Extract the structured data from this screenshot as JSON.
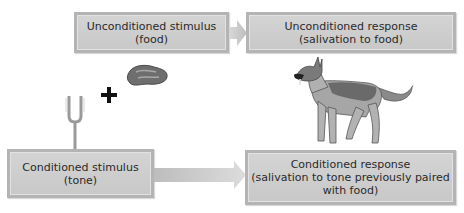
{
  "diagram": {
    "nodes": {
      "us": {
        "line1": "Unconditioned stimulus",
        "line2": "(food)"
      },
      "ur": {
        "line1": "Unconditioned response",
        "line2": "(salivation to food)"
      },
      "cs": {
        "line1": "Conditioned stimulus",
        "line2": "(tone)"
      },
      "cr": {
        "line1": "Conditioned response",
        "line2": "(salivation to tone previously paired",
        "line3": "with food)"
      }
    },
    "plus_sign": "+",
    "edges": [
      {
        "from": "us",
        "to": "ur"
      },
      {
        "from": "cs",
        "to": "cr"
      }
    ],
    "icons": [
      "meat-icon",
      "tuning-fork-icon",
      "dog-icon",
      "plus-icon"
    ],
    "colors": {
      "box_fill": "#cccccc",
      "box_border": "#b4b4b4",
      "arrow": "#c4c4c4",
      "text": "#2a2a2a"
    }
  }
}
